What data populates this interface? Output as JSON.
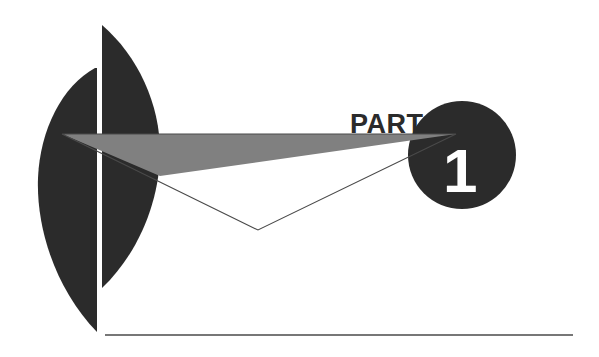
{
  "page": {
    "kind": "book-part-divider",
    "width": 599,
    "height": 357,
    "background_color": "#ffffff"
  },
  "heading": {
    "part_label": "PART",
    "part_number": "1",
    "part_label_color": "#2b2b2b",
    "part_number_color": "#ffffff"
  },
  "palette": {
    "dark": "#2b2b2b",
    "gray": "#808080",
    "line": "#4a4a4a",
    "white": "#ffffff"
  },
  "decor": {
    "left_crescent_name": "left dark lens shape",
    "right_crescent_name": "right dark lens shape",
    "circle_name": "dark filled circle badge",
    "gray_wedge_name": "gray wedge triangle",
    "outline_triangle_name": "thin outlined triangle",
    "baseline_rule_name": "horizontal bottom rule"
  },
  "geometry": {
    "circle": {
      "cx": 462,
      "cy": 155,
      "r": 54
    },
    "triangle_outline": {
      "left": [
        62,
        134
      ],
      "right": [
        456,
        134
      ],
      "bottom": [
        258,
        230
      ]
    },
    "gray_wedge": {
      "left": [
        62,
        134
      ],
      "right": [
        456,
        134
      ],
      "lower": [
        160,
        175
      ]
    },
    "bottom_rule": {
      "x1": 105,
      "y1": 335,
      "x2": 573,
      "y2": 335
    },
    "part_text": {
      "x": 350,
      "y": 133
    },
    "numeral_text": {
      "x": 443,
      "y": 192
    }
  }
}
